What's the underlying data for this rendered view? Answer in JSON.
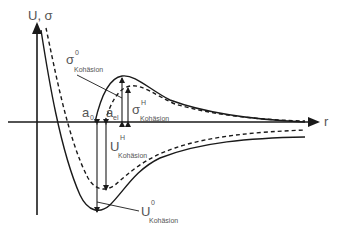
{
  "diagram": {
    "type": "potential-energy-and-cohesive-stress-vs-distance",
    "axes": {
      "y_label": "U, σ",
      "x_label": "r"
    },
    "positions": {
      "a0": {
        "main": "a",
        "sub": "0"
      },
      "a_el": {
        "main": "a",
        "sub": "el"
      }
    },
    "labels": {
      "sigma0": {
        "main": "σ",
        "sup": "0",
        "sub": "Kohäsion"
      },
      "sigmaH": {
        "main": "σ",
        "sup": "H",
        "sub": "Kohäsion"
      },
      "U_H": {
        "main": "U",
        "sup": "H",
        "sub": "Kohäsion"
      },
      "U0": {
        "main": "U",
        "sup": "0",
        "sub": "Kohäsion"
      }
    },
    "curves": [
      {
        "name": "potential-U-solid",
        "style": "solid"
      },
      {
        "name": "potential-U-dashed",
        "style": "dashed"
      },
      {
        "name": "stress-sigma-solid",
        "style": "solid"
      },
      {
        "name": "stress-sigma-dashed",
        "style": "dashed"
      }
    ],
    "colors": {
      "line": "#1a1a1a",
      "text": "#555555",
      "background": "#ffffff"
    }
  }
}
